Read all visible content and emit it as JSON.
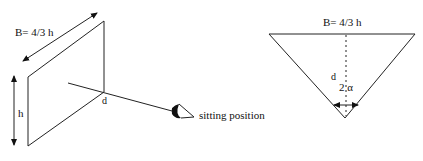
{
  "left_panel": {
    "width_label": "B= 4/3 h",
    "height_label": "h",
    "distance_label": "d",
    "viewer_label": "sitting position",
    "icons": {
      "viewer": "eye-icon"
    }
  },
  "right_panel": {
    "width_label": "B= 4/3 h",
    "distance_label": "d",
    "angle_label": "2 α"
  },
  "colors": {
    "line": "#222222",
    "background": "#ffffff"
  }
}
